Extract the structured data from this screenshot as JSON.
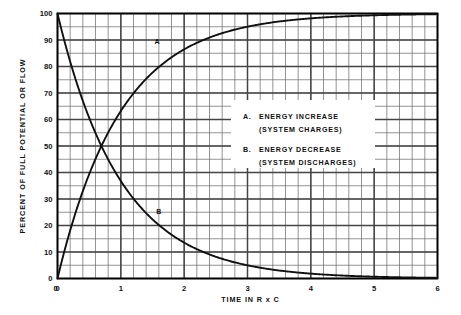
{
  "chart_data": {
    "type": "line",
    "title": "",
    "xlabel": "TIME IN R x C",
    "ylabel": "PERCENT OF FULL POTENTIAL OR FLOW",
    "xlim": [
      0,
      6
    ],
    "ylim": [
      0,
      100
    ],
    "x_major_ticks": [
      0,
      1,
      2,
      3,
      4,
      5,
      6
    ],
    "x_tick_labels": [
      "0",
      "1",
      "2",
      "3",
      "4",
      "5",
      "6"
    ],
    "x_minor_step": 0.2,
    "y_major_ticks": [
      0,
      10,
      20,
      30,
      40,
      50,
      60,
      70,
      80,
      90,
      100
    ],
    "y_tick_labels": [
      "0",
      "10",
      "20",
      "30",
      "40",
      "50",
      "60",
      "70",
      "80",
      "90",
      "100"
    ],
    "y_minor_step": 5,
    "grid": true,
    "legend_position": "center-right-inside",
    "series": [
      {
        "name": "A",
        "label": "A. ENERGY INCREASE (SYSTEM CHARGES)",
        "formula": "100 * (1 - exp(-t))",
        "color": "#111111",
        "x": [
          0,
          0.1,
          0.2,
          0.3,
          0.4,
          0.5,
          0.6,
          0.7,
          0.8,
          0.9,
          1.0,
          1.2,
          1.4,
          1.6,
          1.8,
          2.0,
          2.2,
          2.4,
          2.6,
          2.8,
          3.0,
          3.2,
          3.4,
          3.6,
          3.8,
          4.0,
          4.2,
          4.4,
          4.6,
          4.8,
          5.0,
          5.2,
          5.4,
          5.6,
          5.8,
          6.0
        ],
        "values": [
          0,
          9.5,
          18.1,
          25.9,
          33.0,
          39.3,
          45.1,
          50.3,
          55.1,
          59.3,
          63.2,
          69.9,
          75.3,
          79.8,
          83.5,
          86.5,
          88.9,
          90.9,
          92.6,
          93.9,
          95.0,
          95.9,
          96.7,
          97.3,
          97.8,
          98.2,
          98.5,
          98.8,
          99.0,
          99.2,
          99.3,
          99.4,
          99.5,
          99.6,
          99.7,
          99.8
        ]
      },
      {
        "name": "B",
        "label": "B. ENERGY DECREASE (SYSTEM DISCHARGES)",
        "formula": "100 * exp(-t)",
        "color": "#111111",
        "x": [
          0,
          0.1,
          0.2,
          0.3,
          0.4,
          0.5,
          0.6,
          0.7,
          0.8,
          0.9,
          1.0,
          1.2,
          1.4,
          1.6,
          1.8,
          2.0,
          2.2,
          2.4,
          2.6,
          2.8,
          3.0,
          3.2,
          3.4,
          3.6,
          3.8,
          4.0,
          4.2,
          4.4,
          4.6,
          4.8,
          5.0,
          5.2,
          5.4,
          5.6,
          5.8,
          6.0
        ],
        "values": [
          100,
          90.5,
          81.9,
          74.1,
          67.0,
          60.7,
          54.9,
          49.7,
          44.9,
          40.7,
          36.8,
          30.1,
          24.7,
          20.2,
          16.5,
          13.5,
          11.1,
          9.1,
          7.4,
          6.1,
          5.0,
          4.1,
          3.3,
          2.7,
          2.2,
          1.8,
          1.5,
          1.2,
          1.0,
          0.8,
          0.7,
          0.6,
          0.5,
          0.4,
          0.3,
          0.25
        ]
      }
    ],
    "annotations": [
      {
        "text": "A",
        "x": 1.57,
        "y": 88.5
      },
      {
        "text": "B",
        "x": 1.6,
        "y": 24.5
      }
    ]
  },
  "legend": {
    "entries": [
      {
        "key": "A.",
        "line1": "ENERGY  INCREASE",
        "line2": "(SYSTEM  CHARGES)"
      },
      {
        "key": "B.",
        "line1": "ENERGY  DECREASE",
        "line2": "(SYSTEM  DISCHARGES)"
      }
    ]
  },
  "colors": {
    "curve": "#111111",
    "grid_major": "#444444",
    "grid_minor": "#666666",
    "axis": "#000000",
    "background": "#ffffff",
    "legend_background": "#ffffff"
  }
}
